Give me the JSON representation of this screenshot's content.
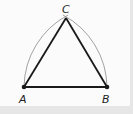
{
  "diagram": {
    "points": {
      "A": {
        "label": "A",
        "x": 24,
        "y": 87
      },
      "B": {
        "label": "B",
        "x": 107,
        "y": 87
      },
      "C": {
        "label": "C",
        "x": 66,
        "y": 18
      }
    },
    "segments": [
      "AB",
      "BC",
      "CA"
    ],
    "arcs": [
      {
        "center": "B",
        "from": "A",
        "to": "C"
      },
      {
        "center": "A",
        "from": "B",
        "to": "C"
      }
    ],
    "colors": {
      "line": "#1a1a1a",
      "arc": "#8a8a8a",
      "background": "#fbfbfb",
      "border": "#e6e6e6"
    }
  }
}
